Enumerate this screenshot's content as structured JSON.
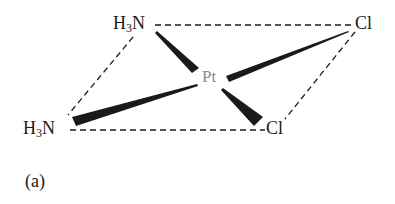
{
  "figure": {
    "caption": "(a)",
    "center_atom": {
      "symbol": "Pt",
      "color": "#8a8a8a"
    },
    "ligands": [
      {
        "id": "nh3_top",
        "main": "H",
        "subscript": "3",
        "rest": "N",
        "position": "top-left"
      },
      {
        "id": "cl_top",
        "symbol": "Cl",
        "position": "top-right"
      },
      {
        "id": "nh3_bottom",
        "main": "H",
        "subscript": "3",
        "rest": "N",
        "position": "bottom-left"
      },
      {
        "id": "cl_bottom",
        "symbol": "Cl",
        "position": "bottom-right"
      }
    ],
    "bonds": [
      {
        "from": "Pt",
        "to": "nh3_top",
        "style": "wedge"
      },
      {
        "from": "Pt",
        "to": "cl_top",
        "style": "wedge"
      },
      {
        "from": "Pt",
        "to": "nh3_bottom",
        "style": "wedge"
      },
      {
        "from": "Pt",
        "to": "cl_bottom",
        "style": "wedge"
      }
    ],
    "outline": {
      "style": "dashed",
      "shape": "parallelogram"
    },
    "colors": {
      "ink": "#1a1a1a",
      "metal": "#8a8a8a"
    }
  }
}
